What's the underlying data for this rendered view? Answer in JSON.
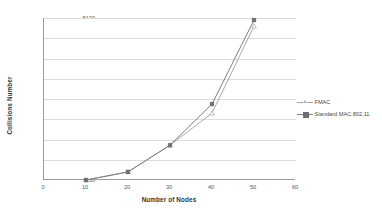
{
  "chart_data": {
    "type": "line",
    "title": "",
    "xlabel": "Number of Nodes",
    "ylabel": "Collisions Number",
    "x": [
      10,
      20,
      30,
      40,
      50
    ],
    "xlim": [
      0,
      60
    ],
    "ylim": [
      130,
      8130
    ],
    "grid": true,
    "legend_position": "right",
    "x_ticks": [
      "0",
      "10",
      "20",
      "30",
      "40",
      "50",
      "60"
    ],
    "x_tick_values": [
      0,
      10,
      20,
      30,
      40,
      50,
      60
    ],
    "y_ticks": [
      "130",
      "1130",
      "2130",
      "3130",
      "4130",
      "5130",
      "6130",
      "7130",
      "8130"
    ],
    "y_tick_values": [
      130,
      1130,
      2130,
      3130,
      4130,
      5130,
      6130,
      7130,
      8130
    ],
    "series": [
      {
        "name": "FMAC",
        "marker": "triangle-open",
        "color": "#b0b0b0",
        "line_color": "#a8a8a8",
        "values": [
          130,
          530,
          1850,
          3430,
          7730
        ]
      },
      {
        "name": "Standard MAC 802.11",
        "marker": "square-filled",
        "color": "#6f6f6f",
        "line_color": "#7d7d7d",
        "values": [
          130,
          530,
          1850,
          3880,
          8030
        ]
      }
    ]
  },
  "legend": {
    "items": [
      {
        "label": "FMAC"
      },
      {
        "label": "Standard MAC 802.11"
      }
    ]
  },
  "axes": {
    "y_title": "Collisions Number",
    "x_title": "Number of Nodes"
  },
  "colors": {
    "axis": "#9a9a9a",
    "grid": "#dcdcdc",
    "series_fmac": "#b0b0b0",
    "series_standard": "#6f6f6f",
    "background": "#ffffff",
    "tick_text": "#5a5a5a",
    "title_text": "#333333"
  }
}
